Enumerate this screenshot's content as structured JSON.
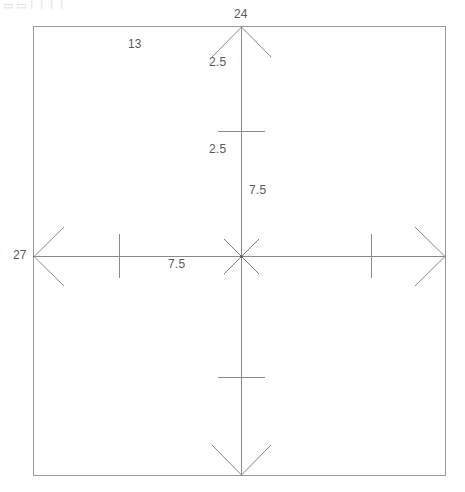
{
  "drawing": {
    "title": "technical-dimension-drawing",
    "frame": {
      "x": 33,
      "y": 26,
      "width": 413,
      "height": 450,
      "stroke_color": "#9a9a9a"
    },
    "axes": {
      "stroke_color": "#8a8a8a",
      "center_x": 241,
      "center_y": 256,
      "vertical": {
        "name": "vertical-axis",
        "top_y": 26,
        "bottom_y": 476
      },
      "horizontal": {
        "name": "horizontal-axis",
        "left_x": 33,
        "right_x": 446
      }
    },
    "arrowheads": [
      {
        "name": "arrowhead-up",
        "direction": "up",
        "tip_x": 241,
        "tip_y": 27
      },
      {
        "name": "arrowhead-down",
        "direction": "down",
        "tip_x": 241,
        "tip_y": 475
      },
      {
        "name": "arrowhead-left",
        "direction": "left",
        "tip_x": 34,
        "tip_y": 256
      },
      {
        "name": "arrowhead-right",
        "direction": "right",
        "tip_x": 445,
        "tip_y": 256
      }
    ],
    "center_cross": {
      "name": "center-diagonal-cross",
      "half_length": 24,
      "stroke_color": "#7d7d7d"
    },
    "tick_marks": [
      {
        "name": "tick-vertical-left",
        "orientation": "vertical",
        "x": 119,
        "y1": 234,
        "y2": 278
      },
      {
        "name": "tick-vertical-right",
        "orientation": "vertical",
        "x": 371,
        "y1": 234,
        "y2": 278
      },
      {
        "name": "tick-horizontal-upper",
        "orientation": "horizontal",
        "y": 131,
        "x1": 218,
        "x2": 265
      },
      {
        "name": "tick-horizontal-lower",
        "orientation": "horizontal",
        "y": 377,
        "x1": 218,
        "x2": 265
      }
    ],
    "labels": [
      {
        "name": "dimension-label-24",
        "text": "24",
        "x": 234,
        "y": 8
      },
      {
        "name": "dimension-label-13",
        "text": "13",
        "x": 128,
        "y": 38
      },
      {
        "name": "dimension-label-2p5-top",
        "text": "2.5",
        "x": 209,
        "y": 56
      },
      {
        "name": "dimension-label-2p5-mid",
        "text": "2.5",
        "x": 209,
        "y": 143
      },
      {
        "name": "dimension-label-7p5-vertical",
        "text": "7.5",
        "x": 249,
        "y": 184
      },
      {
        "name": "dimension-label-27",
        "text": "27",
        "x": 13,
        "y": 249
      },
      {
        "name": "dimension-label-7p5-horizontal",
        "text": "7.5",
        "x": 168,
        "y": 258
      }
    ],
    "partial_toolbar_text": "▭ ▭ │ │ │ │"
  }
}
